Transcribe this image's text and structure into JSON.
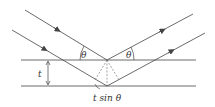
{
  "diagram": {
    "labels": {
      "theta_left": "θ",
      "theta_right": "θ",
      "thickness": "t",
      "path_difference": "t sin θ"
    },
    "colors": {
      "line": "#444444",
      "background": "#ffffff"
    },
    "planes": [
      {
        "name": "upper-plane",
        "y": 60
      },
      {
        "name": "lower-plane",
        "y": 86
      }
    ]
  }
}
